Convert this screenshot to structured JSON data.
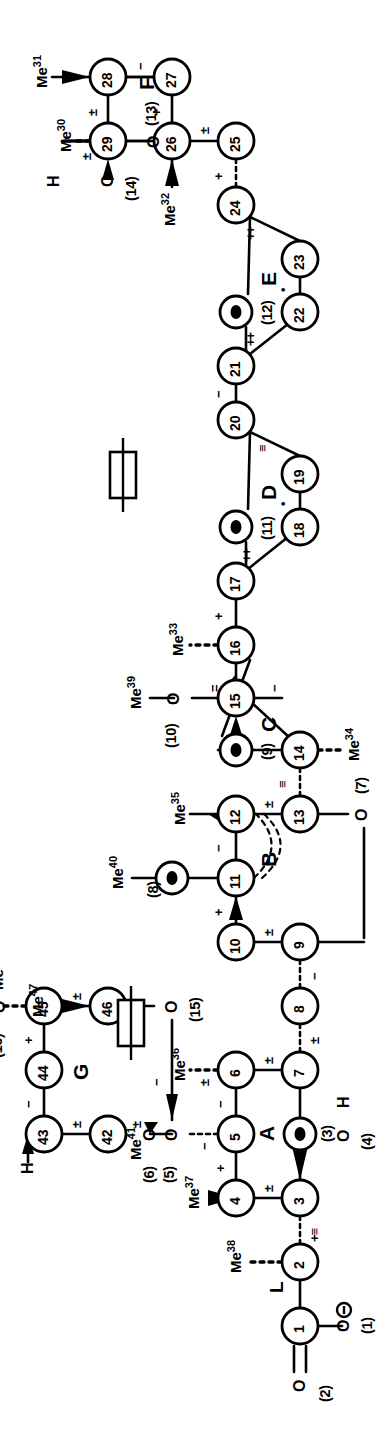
{
  "figure": {
    "kind": "chemical-structure",
    "orientation": "rotated-90-ccw",
    "ring_labels": [
      "A",
      "B",
      "C",
      "D",
      "E",
      "F",
      "G"
    ],
    "linker_label": "L"
  },
  "atoms": [
    {
      "id": "1",
      "label": "1",
      "x": 112,
      "y": 300
    },
    {
      "id": "2",
      "label": "2",
      "x": 176,
      "y": 300
    },
    {
      "id": "3",
      "label": "3",
      "x": 240,
      "y": 300
    },
    {
      "id": "4",
      "label": "4",
      "x": 240,
      "y": 236
    },
    {
      "id": "5",
      "label": "5",
      "x": 304,
      "y": 236
    },
    {
      "id": "6",
      "label": "6",
      "x": 368,
      "y": 236
    },
    {
      "id": "7",
      "label": "7",
      "x": 368,
      "y": 300
    },
    {
      "id": "8",
      "label": "8",
      "x": 432,
      "y": 300
    },
    {
      "id": "9",
      "label": "9",
      "x": 496,
      "y": 300
    },
    {
      "id": "10",
      "label": "10",
      "x": 496,
      "y": 236
    },
    {
      "id": "11",
      "label": "11",
      "x": 560,
      "y": 236
    },
    {
      "id": "12",
      "label": "12",
      "x": 624,
      "y": 236
    },
    {
      "id": "13",
      "label": "13",
      "x": 624,
      "y": 300
    },
    {
      "id": "14",
      "label": "14",
      "x": 688,
      "y": 300
    },
    {
      "id": "15",
      "label": "15",
      "x": 740,
      "y": 236
    },
    {
      "id": "16",
      "label": "16",
      "x": 793,
      "y": 236
    },
    {
      "id": "17",
      "label": "17",
      "x": 857,
      "y": 236
    },
    {
      "id": "18",
      "label": "18",
      "x": 911,
      "y": 300
    },
    {
      "id": "19",
      "label": "19",
      "x": 964,
      "y": 300
    },
    {
      "id": "20",
      "label": "20",
      "x": 1018,
      "y": 236
    },
    {
      "id": "21",
      "label": "21",
      "x": 1072,
      "y": 236
    },
    {
      "id": "22",
      "label": "22",
      "x": 1126,
      "y": 300
    },
    {
      "id": "23",
      "label": "23",
      "x": 1179,
      "y": 300
    },
    {
      "id": "24",
      "label": "24",
      "x": 1233,
      "y": 236
    },
    {
      "id": "25",
      "label": "25",
      "x": 1297,
      "y": 236
    },
    {
      "id": "26",
      "label": "26",
      "x": 1297,
      "y": 172
    },
    {
      "id": "27",
      "label": "27",
      "x": 1361,
      "y": 172
    },
    {
      "id": "28",
      "label": "28",
      "x": 1361,
      "y": 108
    },
    {
      "id": "29",
      "label": "29",
      "x": 1297,
      "y": 108
    },
    {
      "id": "42",
      "label": "42",
      "x": 304,
      "y": 108
    },
    {
      "id": "43",
      "label": "43",
      "x": 304,
      "y": 44
    },
    {
      "id": "44",
      "label": "44",
      "x": 368,
      "y": 44
    },
    {
      "id": "45",
      "label": "45",
      "x": 432,
      "y": 44
    },
    {
      "id": "46",
      "label": "46",
      "x": 432,
      "y": 108
    }
  ],
  "ring_oxygens": [
    {
      "id": "O3",
      "label": "(3)",
      "x": 304,
      "y": 300
    },
    {
      "id": "O9",
      "label": "(9)",
      "x": 688,
      "y": 236
    },
    {
      "id": "O11",
      "label": "(11)",
      "x": 911,
      "y": 236
    },
    {
      "id": "O12",
      "label": "(12)",
      "x": 1126,
      "y": 236
    },
    {
      "id": "O8",
      "label": "(8)",
      "x": 560,
      "y": 172
    }
  ],
  "oxygen_labels": [
    {
      "id": "O1",
      "text": "O",
      "paren": "(1)",
      "x": 112,
      "y": 360,
      "charge": "minus"
    },
    {
      "id": "O2",
      "text": "O",
      "paren": "(2)",
      "x": 52,
      "y": 300,
      "charge": "none"
    },
    {
      "id": "O4",
      "text": "O",
      "paren": "(4)",
      "x": 240,
      "y": 360,
      "charge": "none"
    },
    {
      "id": "O5",
      "text": "O",
      "paren": "(5)",
      "x": 304,
      "y": 172,
      "charge": "none"
    },
    {
      "id": "O6",
      "text": "O",
      "paren": "(6)",
      "x": 304,
      "y": 150,
      "charge": "none"
    },
    {
      "id": "O7",
      "text": "O",
      "paren": "(7)",
      "x": 624,
      "y": 364,
      "charge": "none"
    },
    {
      "id": "O10",
      "text": "O",
      "paren": "(10)",
      "x": 740,
      "y": 174,
      "charge": "none"
    },
    {
      "id": "O13",
      "text": "O",
      "paren": "(13)",
      "x": 1361,
      "y": 108,
      "charge": "none"
    },
    {
      "id": "O14",
      "text": "O",
      "paren": "(14)",
      "x": 1297,
      "y": 46,
      "charge": "none"
    },
    {
      "id": "O15",
      "text": "O",
      "paren": "(15)",
      "x": 432,
      "y": 172,
      "charge": "none"
    },
    {
      "id": "O16",
      "text": "O",
      "paren": "(16)",
      "x": 432,
      "y": -18,
      "charge": "none"
    }
  ],
  "methyls": [
    {
      "id": "Me30",
      "text": "Me",
      "sup": "30",
      "attached_to": "29"
    },
    {
      "id": "Me31",
      "text": "Me",
      "sup": "31",
      "attached_to": "28"
    },
    {
      "id": "Me32",
      "text": "Me",
      "sup": "32",
      "attached_to": "26"
    },
    {
      "id": "Me33",
      "text": "Me",
      "sup": "33",
      "attached_to": "16"
    },
    {
      "id": "Me34",
      "text": "Me",
      "sup": "34",
      "attached_to": "14"
    },
    {
      "id": "Me35",
      "text": "Me",
      "sup": "35",
      "attached_to": "12"
    },
    {
      "id": "Me36",
      "text": "Me",
      "sup": "36",
      "attached_to": "6"
    },
    {
      "id": "Me37",
      "text": "Me",
      "sup": "37",
      "attached_to": "4"
    },
    {
      "id": "Me38",
      "text": "Me",
      "sup": "38",
      "attached_to": "2"
    },
    {
      "id": "Me39",
      "text": "Me",
      "sup": "39",
      "attached_to": "O10"
    },
    {
      "id": "Me40",
      "text": "Me",
      "sup": "40",
      "attached_to": "O8"
    },
    {
      "id": "Me41",
      "text": "Me",
      "sup": "41",
      "attached_to": "O5"
    },
    {
      "id": "Me47",
      "text": "Me",
      "sup": "47",
      "attached_to": "46"
    },
    {
      "id": "Me48",
      "text": "Me",
      "sup": "48",
      "attached_to": "O16"
    }
  ],
  "hydrogens": [
    {
      "id": "H-O4",
      "text": "H",
      "attached_to": "O4"
    },
    {
      "id": "H-O14",
      "text": "H",
      "attached_to": "O14"
    },
    {
      "id": "H-43",
      "text": "H",
      "attached_to": "43"
    }
  ],
  "bond_marks": [
    {
      "id": "m-2-3",
      "text": "+",
      "second": "≡"
    },
    {
      "id": "m-3-4",
      "text": "±"
    },
    {
      "id": "m-4-5",
      "text": "+"
    },
    {
      "id": "m-5-6",
      "text": "−"
    },
    {
      "id": "m-5-O5",
      "text": "−"
    },
    {
      "id": "m-6-7",
      "text": "±"
    },
    {
      "id": "m-6-36",
      "text": "±"
    },
    {
      "id": "m-7-8",
      "text": "±"
    },
    {
      "id": "m-8-9",
      "text": "−"
    },
    {
      "id": "m-9-10",
      "text": "±"
    },
    {
      "id": "m-10-11",
      "text": "+"
    },
    {
      "id": "m-11-12",
      "text": "−"
    },
    {
      "id": "m-12-13",
      "text": "±"
    },
    {
      "id": "m-13-14",
      "text": "≡"
    },
    {
      "id": "m-14-15",
      "text": "−"
    },
    {
      "id": "m-15-16",
      "text": "="
    },
    {
      "id": "m-16-17",
      "text": "+"
    },
    {
      "id": "m-17-18",
      "text": "++"
    },
    {
      "id": "m-18-19",
      "text": "•"
    },
    {
      "id": "m-19-20",
      "text": "≡"
    },
    {
      "id": "m-20-21",
      "text": "−"
    },
    {
      "id": "m-21-22",
      "text": "++"
    },
    {
      "id": "m-22-23",
      "text": "•"
    },
    {
      "id": "m-23-24",
      "text": "++"
    },
    {
      "id": "m-24-25",
      "text": "+"
    },
    {
      "id": "m-25-26",
      "text": "±"
    },
    {
      "id": "m-26-27",
      "text": "+"
    },
    {
      "id": "m-27-28",
      "text": "−"
    },
    {
      "id": "m-28-29",
      "text": "±"
    },
    {
      "id": "m-29-O14",
      "text": "±"
    },
    {
      "id": "m-42-43",
      "text": "±"
    },
    {
      "id": "m-42-O6",
      "text": "±"
    },
    {
      "id": "m-43-44",
      "text": "−"
    },
    {
      "id": "m-44-45",
      "text": "+"
    },
    {
      "id": "m-45-46",
      "text": "±"
    },
    {
      "id": "m-6-O6",
      "text": "−"
    }
  ],
  "markers": [
    {
      "id": "box-marker-1",
      "name": "rectangle-marker"
    },
    {
      "id": "box-marker-2",
      "name": "rectangle-marker"
    }
  ]
}
